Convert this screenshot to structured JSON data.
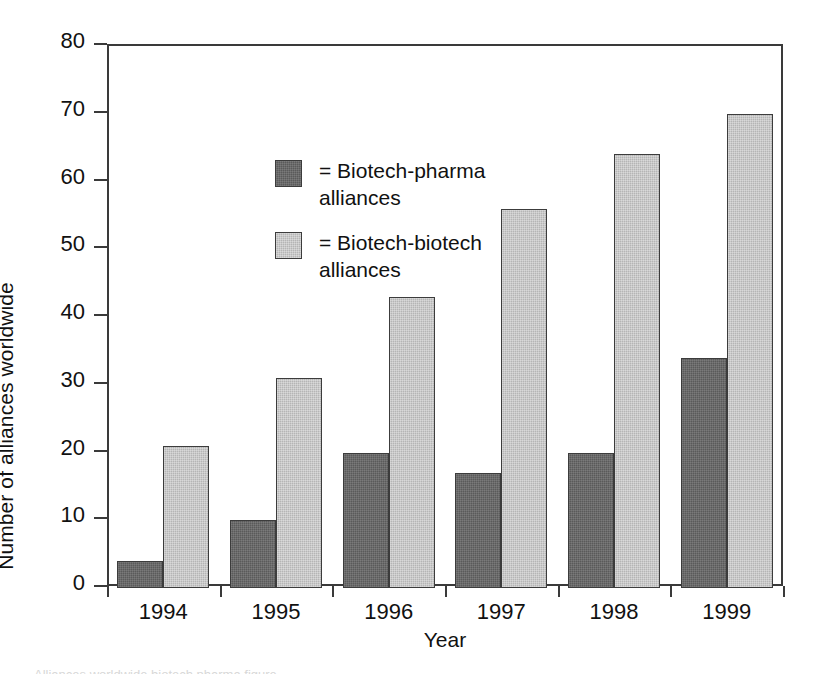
{
  "chart_data": {
    "type": "bar",
    "title": "",
    "subtitle": "",
    "xlabel": "Year",
    "ylabel": "Number of alliances worldwide",
    "categories": [
      "1994",
      "1995",
      "1996",
      "1997",
      "1998",
      "1999"
    ],
    "series": [
      {
        "name": "Biotech-pharma alliances",
        "legend_label": "= Biotech-pharma alliances",
        "color": "#5a5a5a",
        "values": [
          4,
          10,
          20,
          17,
          20,
          34
        ]
      },
      {
        "name": "Biotech-biotech alliances",
        "legend_label": "= Biotech-biotech alliances",
        "color": "#b5b5b5",
        "values": [
          21,
          31,
          43,
          56,
          64,
          70
        ]
      }
    ],
    "ylim": [
      0,
      80
    ],
    "yticks": [
      0,
      10,
      20,
      30,
      40,
      50,
      60,
      70,
      80
    ],
    "ytick_labels": [
      "0",
      "10",
      "20",
      "30",
      "40",
      "50",
      "60",
      "70",
      "80"
    ],
    "grid": false,
    "legend_position": "upper-left-inside",
    "frame": "box",
    "axis_color": "#3a3a3a",
    "background_color": "#ffffff"
  },
  "legend": {
    "rows": [
      {
        "swatch": "dark-gray-swatch",
        "line1": "= Biotech-pharma",
        "line2": "alliances"
      },
      {
        "swatch": "light-gray-swatch",
        "line1": "= Biotech-biotech",
        "line2": "alliances"
      }
    ]
  },
  "axes": {
    "y_title": "Number of alliances worldwide",
    "x_title": "Year",
    "y_labels": [
      "80",
      "70",
      "60",
      "50",
      "40",
      "30",
      "20",
      "10",
      "0"
    ],
    "x_labels": [
      "1994",
      "1995",
      "1996",
      "1997",
      "1998",
      "1999"
    ]
  },
  "caption_strip": {
    "clipped_text": "Alliances worldwide biotech pharma figure"
  }
}
